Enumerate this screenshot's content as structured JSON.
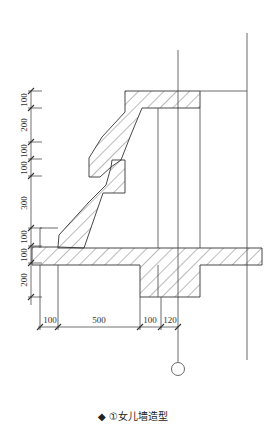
{
  "caption": {
    "bullet": "◆",
    "text": "①女儿墙造型"
  },
  "dimensions": {
    "vertical": [
      "100",
      "200",
      "100",
      "100",
      "300",
      "100",
      "100",
      "200"
    ],
    "horizontal": [
      "100",
      "500",
      "100",
      "120"
    ]
  },
  "colors": {
    "line": "#333333",
    "hatch": "#555555",
    "background": "#ffffff"
  }
}
